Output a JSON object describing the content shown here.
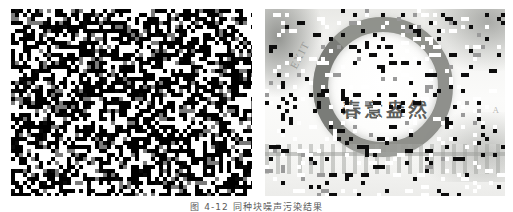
{
  "figure": {
    "caption": "图 4-12   同种块噪声污染结果",
    "panel_count": 2
  },
  "panels": [
    {
      "id": "noisy-dense",
      "label": "左图",
      "description": "高密度块状椒盐噪声图像",
      "background_color": "#0a0a0a",
      "noise": {
        "type": "block-salt-pepper",
        "block_size": 4,
        "density": 0.92,
        "dark_color": "#000000",
        "light_color": "#ffffff",
        "mid_gray": "#7a7a7a"
      },
      "geometry": {
        "x": 11,
        "y": 9,
        "width": 241,
        "height": 187
      }
    },
    {
      "id": "noisy-sparse",
      "label": "右图",
      "description": "低密度块状噪声污染的花环照片",
      "background_color": "#f2f2f0",
      "noise": {
        "type": "block-salt-pepper",
        "block_size": 4,
        "density": 0.14,
        "dark_color": "#0d0d0d",
        "light_color": "#ffffff",
        "mid_gray": "#9a9a9a"
      },
      "photo": {
        "slogan": "春意盎然",
        "mark_left": "EXIT",
        "mark_right": "A",
        "ring_color": "#747670",
        "fence_color": "#a8aaa6"
      },
      "geometry": {
        "x": 265,
        "y": 9,
        "width": 240,
        "height": 187
      }
    }
  ],
  "colors": {
    "page_background": "#ffffff",
    "caption_text": "#5b5b5b",
    "panel_dark": "#0a0a0a",
    "panel_light": "#f2f2f0"
  }
}
